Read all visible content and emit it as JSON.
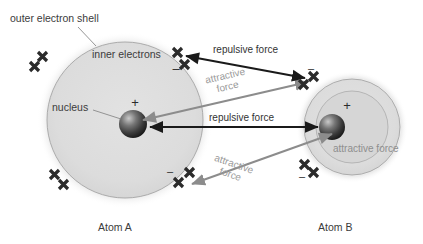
{
  "diagram": {
    "background_color": "#ffffff",
    "shell_fill_color": "#dcdcdc",
    "shell_stroke_color": "#9a9a9a",
    "electron_color": "#2b2b2b",
    "arrow_black_color": "#1a1a1a",
    "arrow_gray_color": "#8c8c8c",
    "text_color": "#3b3b3b",
    "gray_text_color": "#9a9a9a"
  },
  "labels": {
    "outer_electron_shell": "outer electron shell",
    "inner_electrons": "inner electrons",
    "nucleus": "nucleus",
    "atom_a": "Atom A",
    "atom_b": "Atom B",
    "repulsive_force_top": "repulsive force",
    "repulsive_force_middle": "repulsive force",
    "attractive_force_upper_line1": "attractive",
    "attractive_force_upper_line2": "force",
    "attractive_force_lower_line1": "attractive",
    "attractive_force_lower_line2": "force",
    "attractive_force_atom_b": "attractive force",
    "nucleus_charge_a": "+",
    "nucleus_charge_b": "+",
    "electron_charge_a_top": "–",
    "electron_charge_a_bottom": "–",
    "electron_charge_b_top": "–",
    "electron_charge_b_bottom": "–"
  },
  "atoms": [
    {
      "name": "Atom A",
      "shell_center_x": 125,
      "shell_center_y": 120,
      "shell_radius": 78,
      "nucleus_center_x": 133,
      "nucleus_center_y": 124,
      "nucleus_radius": 14,
      "electron_pairs": [
        {
          "position": "upper-left",
          "x": 41,
          "y": 62
        },
        {
          "position": "upper-right",
          "x": 182,
          "y": 58
        },
        {
          "position": "lower-left",
          "x": 58,
          "y": 180
        },
        {
          "position": "lower-right",
          "x": 188,
          "y": 180
        }
      ]
    },
    {
      "name": "Atom B",
      "shell_center_x": 352,
      "shell_center_y": 127,
      "shell_radius": 48,
      "inner_ring_radius": 36,
      "nucleus_center_x": 332,
      "nucleus_center_y": 127,
      "nucleus_radius": 13,
      "electron_pairs": [
        {
          "position": "upper-left",
          "x": 309,
          "y": 85
        },
        {
          "position": "lower-left",
          "x": 312,
          "y": 172
        }
      ]
    }
  ],
  "forces": [
    {
      "kind": "repulsive",
      "style": "black-double-arrow",
      "label": "repulsive force",
      "from_x": 186,
      "from_y": 56,
      "to_x": 305,
      "to_y": 78,
      "description": "between outer electrons of Atom A and Atom B"
    },
    {
      "kind": "repulsive",
      "style": "black-double-arrow",
      "label": "repulsive force",
      "from_x": 150,
      "from_y": 127,
      "to_x": 318,
      "to_y": 127,
      "description": "between the two nuclei"
    },
    {
      "kind": "attractive",
      "style": "gray-double-arrow",
      "label": "attractive force",
      "from_x": 143,
      "from_y": 120,
      "to_x": 308,
      "to_y": 82,
      "description": "nucleus of Atom A to upper electrons of Atom B"
    },
    {
      "kind": "attractive",
      "style": "gray-double-arrow",
      "label": "attractive force",
      "from_x": 332,
      "from_y": 134,
      "to_x": 192,
      "to_y": 184,
      "description": "nucleus of Atom B to lower-right electrons of Atom A"
    }
  ],
  "leader_lines": [
    {
      "name": "outer-shell-leader",
      "from_x": 78,
      "from_y": 27,
      "to_x": 96,
      "to_y": 46
    },
    {
      "name": "nucleus-leader",
      "from_x": 93,
      "from_y": 110,
      "to_x": 121,
      "to_y": 119
    }
  ]
}
